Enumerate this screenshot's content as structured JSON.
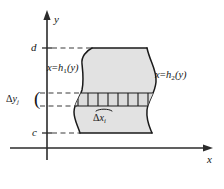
{
  "figure": {
    "kind": "math-diagram",
    "axes": {
      "x_label": "x",
      "y_label": "y",
      "origin_x": 47,
      "origin_y": 148
    },
    "bounds": {
      "upper_label": "d",
      "lower_label": "c",
      "upper_y": 48,
      "lower_y": 133
    },
    "curves": {
      "left_label_parts": {
        "var": "x",
        "eq": "=",
        "fn": "h",
        "sub": "1",
        "arg": "(y)"
      },
      "left_label_text": "x = h₁(y)",
      "right_label_parts": {
        "var": "x",
        "eq": "=",
        "fn": "h",
        "sub": "2",
        "arg": "(y)"
      },
      "right_label_text": "x = h₂(y)"
    },
    "slice": {
      "dy_label_parts": {
        "delta": "Δ",
        "var": "y",
        "sub": "j"
      },
      "dy_label_text": "Δy_j",
      "dx_label_parts": {
        "delta": "Δ",
        "var": "x",
        "sub": "i"
      },
      "dx_label_text": "Δx_i",
      "strip_count": 8,
      "band_top_y": 93,
      "band_bottom_y": 106
    },
    "colors": {
      "fill": "#e2e2e2",
      "outline": "#1a1a1a",
      "axis": "#2b2b2b",
      "dashed": "#3a3a3a",
      "text": "#141414",
      "background": "#ffffff"
    }
  }
}
